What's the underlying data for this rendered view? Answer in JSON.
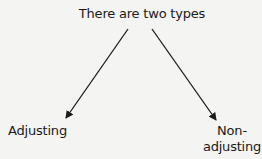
{
  "diagram": {
    "root": {
      "label": "There are two types"
    },
    "children": [
      {
        "label": "Adjusting"
      },
      {
        "label": "Non-\nadjusting",
        "lines": [
          "Non-",
          "adjusting"
        ]
      }
    ],
    "edges": [
      {
        "from": "root",
        "to": "Adjusting"
      },
      {
        "from": "root",
        "to": "Non-adjusting"
      }
    ],
    "colors": {
      "background": "#f4f4f2",
      "line": "#1a1a1a",
      "text": "#1a1a1a"
    }
  }
}
